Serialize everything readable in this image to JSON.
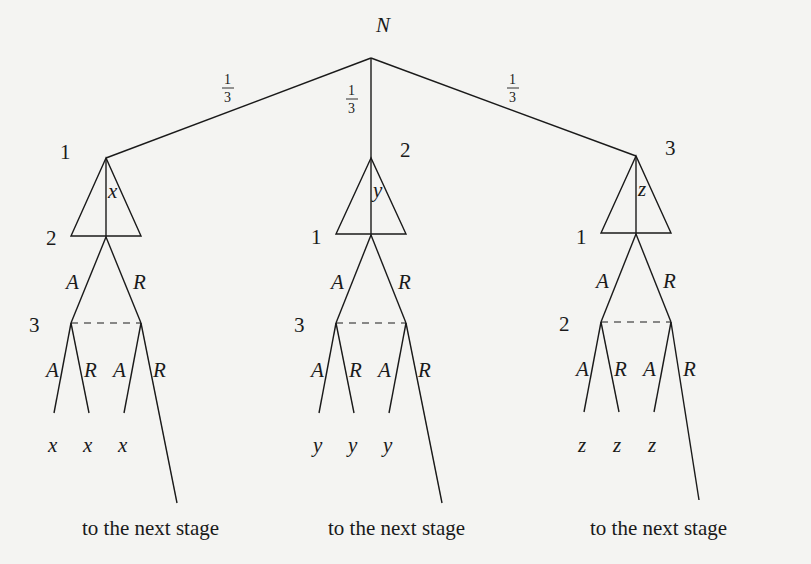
{
  "diagram": {
    "type": "extensive-form game tree",
    "root": {
      "label": "N",
      "x": 371,
      "y": 58
    },
    "chance_probabilities": [
      {
        "num": "1",
        "den": "3",
        "x": 228,
        "y": 86
      },
      {
        "num": "1",
        "den": "3",
        "x": 351,
        "y": 96
      },
      {
        "num": "1",
        "den": "3",
        "x": 513,
        "y": 86
      }
    ],
    "subtrees": [
      {
        "first_mover": "1",
        "proposal": "x",
        "responder": "2",
        "third_player": "3",
        "apex": [
          106,
          158
        ],
        "base_y": 237,
        "infoset_y": 323,
        "leaf_payoffs": [
          "x",
          "x",
          "x"
        ],
        "continuation": "to the next stage"
      },
      {
        "first_mover": "2",
        "proposal": "y",
        "responder": "1",
        "third_player": "3",
        "apex": [
          371,
          158
        ],
        "base_y": 235,
        "infoset_y": 323,
        "leaf_payoffs": [
          "y",
          "y",
          "y"
        ],
        "continuation": "to the next stage"
      },
      {
        "first_mover": "3",
        "proposal": "z",
        "responder": "1",
        "third_player": "2",
        "apex": [
          636,
          156
        ],
        "base_y": 233,
        "infoset_y": 322,
        "leaf_payoffs": [
          "z",
          "z",
          "z"
        ],
        "continuation": "to the next stage"
      }
    ],
    "actions": {
      "accept": "A",
      "reject": "R"
    }
  },
  "labels": {
    "root": "N",
    "p_left_num": "1",
    "p_left_den": "3",
    "p_mid_num": "1",
    "p_mid_den": "3",
    "p_right_num": "1",
    "p_right_den": "3",
    "s0_first": "1",
    "s0_prop": "x",
    "s0_resp": "2",
    "s0_third": "3",
    "s1_first": "2",
    "s1_prop": "y",
    "s1_resp": "1",
    "s1_third": "3",
    "s2_first": "3",
    "s2_prop": "z",
    "s2_resp": "1",
    "s2_third": "2",
    "accept": "A",
    "reject": "R",
    "s0_leaf": "x",
    "s1_leaf": "y",
    "s2_leaf": "z",
    "next_stage": "to the next stage"
  }
}
